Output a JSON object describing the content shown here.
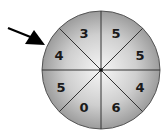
{
  "spinner": {
    "center": {
      "x": 101,
      "y": 70
    },
    "radius": 59,
    "sectors_clockwise_from_top": [
      {
        "position": "top-right",
        "value": "5"
      },
      {
        "position": "right-upper",
        "value": "5"
      },
      {
        "position": "right-lower",
        "value": "4"
      },
      {
        "position": "bottom-right",
        "value": "6"
      },
      {
        "position": "bottom-left",
        "value": "0"
      },
      {
        "position": "left-lower",
        "value": "5"
      },
      {
        "position": "left-upper",
        "value": "4"
      },
      {
        "position": "top-left",
        "value": "3"
      }
    ],
    "pointer": {
      "target": "left-upper",
      "value": "4"
    },
    "colors": {
      "center": "#f4f4f4",
      "edge": "#9a9a9a",
      "lines": "#333333"
    }
  }
}
